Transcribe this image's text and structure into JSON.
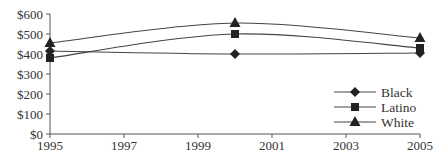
{
  "chart_data": {
    "type": "line",
    "title": "",
    "xlabel": "",
    "ylabel": "",
    "x": [
      1995,
      2000,
      2005
    ],
    "x_ticks": [
      "1995",
      "1997",
      "1999",
      "2001",
      "2003",
      "2005"
    ],
    "y_ticks": [
      "$0",
      "$100",
      "$200",
      "$300",
      "$400",
      "$500",
      "$600"
    ],
    "xlim": [
      1995,
      2005
    ],
    "ylim": [
      0,
      600
    ],
    "grid": false,
    "legend_position": "lower right",
    "series": [
      {
        "name": "Black",
        "marker": "diamond",
        "values": [
          415,
          400,
          405
        ]
      },
      {
        "name": "Latino",
        "marker": "square",
        "values": [
          380,
          500,
          430
        ]
      },
      {
        "name": "White",
        "marker": "triangle",
        "values": [
          455,
          555,
          480
        ]
      }
    ]
  },
  "colors": {
    "line": "#444444",
    "marker": "#222222",
    "axis": "#555555",
    "text": "#333333"
  }
}
